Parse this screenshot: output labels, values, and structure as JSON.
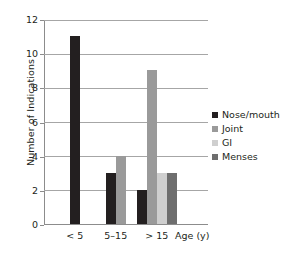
{
  "chart_data": {
    "type": "bar",
    "title": "",
    "subtitle": "",
    "xlabel": "Age (y)",
    "ylabel": "Number of Indications",
    "categories": [
      "< 5",
      "5–15",
      "> 15"
    ],
    "series": [
      {
        "name": "Nose/mouth",
        "color": "#231f20",
        "values": [
          11,
          3,
          2
        ]
      },
      {
        "name": "Joint",
        "color": "#9a9a9a",
        "values": [
          null,
          4,
          9
        ]
      },
      {
        "name": "GI",
        "color": "#cfcfcf",
        "values": [
          null,
          null,
          3
        ]
      },
      {
        "name": "Menses",
        "color": "#6e6e6e",
        "values": [
          null,
          null,
          3
        ]
      }
    ],
    "ylim": [
      0,
      12
    ],
    "ytick_values": [
      0,
      2,
      4,
      6,
      8,
      10,
      12
    ],
    "ytick_labels": [
      "0",
      "2",
      "4",
      "6",
      "8",
      "10",
      "12"
    ],
    "grid": true,
    "grid_axis": "y",
    "legend_position": "right",
    "legend_entries": [
      "Nose/mouth",
      "Joint",
      "GI",
      "Menses"
    ],
    "annotations": []
  },
  "colors": {
    "background": "#ffffff",
    "text": "#231f20",
    "axis": "#8c8c8c",
    "gridline": "#a6a6a6"
  }
}
